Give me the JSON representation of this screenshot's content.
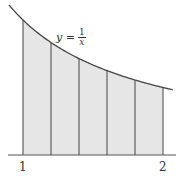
{
  "diagram": {
    "equation": {
      "lhs": "y =",
      "numerator": "1",
      "denominator": "x"
    },
    "x_ticks": [
      {
        "label": "1",
        "value": 1
      },
      {
        "label": "2",
        "value": 2
      }
    ],
    "subdivisions": 5,
    "partition_points": [
      1.0,
      1.2,
      1.4,
      1.6,
      1.8,
      2.0
    ],
    "fill_color": "#e6e6e6",
    "line_color": "#333333"
  }
}
